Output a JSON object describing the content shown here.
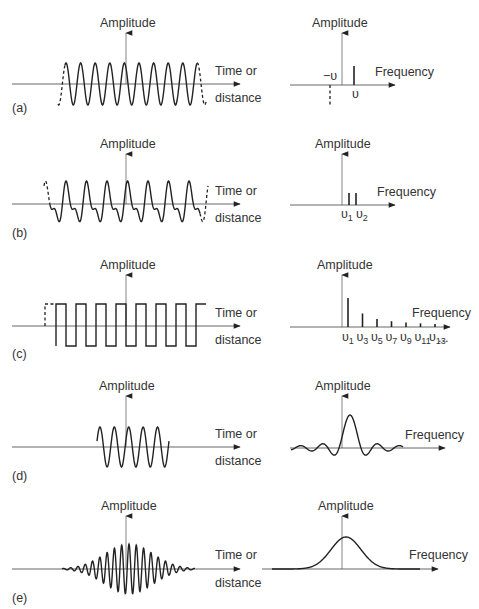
{
  "figure": {
    "rows": [
      {
        "tag": "(a)",
        "description": "Infinite sine wave -> single frequency pair",
        "time_domain": {
          "y_label": "Amplitude",
          "x_label_line1": "Time or",
          "x_label_line2": "distance"
        },
        "freq_domain": {
          "y_label": "Amplitude",
          "x_label": "Frequency",
          "tick_labels": [
            "−υ",
            "υ"
          ]
        }
      },
      {
        "tag": "(b)",
        "description": "Sum of two sine waves -> two frequencies",
        "time_domain": {
          "y_label": "Amplitude",
          "x_label_line1": "Time or",
          "x_label_line2": "distance"
        },
        "freq_domain": {
          "y_label": "Amplitude",
          "x_label": "Frequency",
          "tick_labels": [
            "υ1",
            "υ2"
          ]
        }
      },
      {
        "tag": "(c)",
        "description": "Square wave -> odd harmonics",
        "time_domain": {
          "y_label": "Amplitude",
          "x_label_line1": "Time or",
          "x_label_line2": "distance"
        },
        "freq_domain": {
          "y_label": "Amplitude",
          "x_label": "Frequency",
          "tick_labels": [
            "υ1",
            "υ3",
            "υ5",
            "υ7",
            "υ9",
            "υ11",
            "υ13",
            "..."
          ]
        }
      },
      {
        "tag": "(d)",
        "description": "Truncated sine wave -> sinc function",
        "time_domain": {
          "y_label": "Amplitude",
          "x_label_line1": "Time or",
          "x_label_line2": "distance"
        },
        "freq_domain": {
          "y_label": "Amplitude",
          "x_label": "Frequency",
          "tick_labels": []
        }
      },
      {
        "tag": "(e)",
        "description": "Gaussian wave packet -> Gaussian spectrum",
        "time_domain": {
          "y_label": "Amplitude",
          "x_label_line1": "Time or",
          "x_label_line2": "distance"
        },
        "freq_domain": {
          "y_label": "Amplitude",
          "x_label": "Frequency",
          "tick_labels": []
        }
      }
    ]
  },
  "colors": {
    "ink": "#222222",
    "axis": "#555555",
    "text": "#333333",
    "background": "#ffffff"
  }
}
